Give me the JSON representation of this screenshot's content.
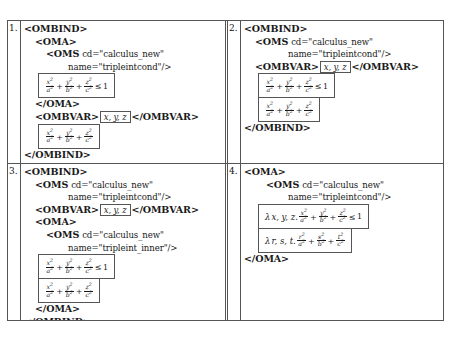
{
  "figure": {
    "type": "table",
    "rows": 2,
    "columns": 2,
    "panel_count": 4
  },
  "symbols": {
    "lambda": "λ",
    "leq": "≤",
    "plus": "+",
    "one": "1",
    "open_angle": "<",
    "close_angle": ">",
    "slash": "/"
  },
  "panels": [
    {
      "number": "1.",
      "lines": [
        {
          "indent": 0,
          "tag": "<OMBIND>",
          "attr": ""
        },
        {
          "indent": 1,
          "tag": "<OMA>",
          "attr": ""
        },
        {
          "indent": 2,
          "tag": "<OMS",
          "attr": "cd=\"calculus_new\""
        },
        {
          "indent": 3,
          "tag": "",
          "attr": "name=\"tripleintcond\"/>"
        }
      ],
      "formula_1": {
        "lambda": "",
        "vars": "",
        "terms": [
          "x/a",
          "y/b",
          "z/c"
        ],
        "relation": "≤",
        "rhs": "1"
      },
      "line_after_f1": {
        "indent": 1,
        "tag": "</OMA>",
        "attr": ""
      },
      "ombvar_line": {
        "indent": 1,
        "open": "<OMBVAR>",
        "vars": "x, y, z",
        "close": "</OMBVAR>"
      },
      "formula_2": {
        "lambda": "",
        "vars": "",
        "terms": [
          "x/a",
          "y/b",
          "z/c"
        ],
        "relation": "",
        "rhs": ""
      },
      "closing": [
        {
          "indent": 0,
          "tag": "</OMBIND>",
          "attr": ""
        }
      ]
    },
    {
      "number": "2.",
      "lines": [
        {
          "indent": 0,
          "tag": "<OMBIND>",
          "attr": ""
        },
        {
          "indent": 1,
          "tag": "<OMS",
          "attr": "cd=\"calculus_new\""
        },
        {
          "indent": 3,
          "tag": "",
          "attr": "name=\"tripleintcond\"/>"
        }
      ],
      "ombvar_line": {
        "indent": 1,
        "open": "<OMBVAR>",
        "vars": "x, y, z",
        "close": "</OMBVAR>"
      },
      "formula_1": {
        "lambda": "",
        "vars": "",
        "terms": [
          "x/a",
          "y/b",
          "z/c"
        ],
        "relation": "≤",
        "rhs": "1"
      },
      "formula_2": {
        "lambda": "",
        "vars": "",
        "terms": [
          "x/a",
          "y/b",
          "z/c"
        ],
        "relation": "",
        "rhs": ""
      },
      "closing": [
        {
          "indent": 0,
          "tag": "</OMBIND>",
          "attr": ""
        }
      ]
    },
    {
      "number": "3.",
      "lines": [
        {
          "indent": 0,
          "tag": "<OMBIND>",
          "attr": ""
        },
        {
          "indent": 1,
          "tag": "<OMS",
          "attr": "cd=\"calculus_new\""
        },
        {
          "indent": 3,
          "tag": "",
          "attr": "name=\"tripleintcond\"/>"
        }
      ],
      "ombvar_line": {
        "indent": 1,
        "open": "<OMBVAR>",
        "vars": "x, y, z",
        "close": "</OMBVAR>"
      },
      "inner_lines": [
        {
          "indent": 1,
          "tag": "<OMA>",
          "attr": ""
        },
        {
          "indent": 2,
          "tag": "<OMS",
          "attr": "cd=\"calculus_new\""
        },
        {
          "indent": 3,
          "tag": "",
          "attr": "name=\"tripleint_inner\"/>"
        }
      ],
      "formula_1": {
        "lambda": "",
        "vars": "",
        "terms": [
          "x/a",
          "y/b",
          "z/c"
        ],
        "relation": "≤",
        "rhs": "1"
      },
      "formula_2": {
        "lambda": "",
        "vars": "",
        "terms": [
          "x/a",
          "y/b",
          "z/c"
        ],
        "relation": "",
        "rhs": ""
      },
      "closing": [
        {
          "indent": 1,
          "tag": "</OMA>",
          "attr": ""
        },
        {
          "indent": 0,
          "tag": "</OMBIND>",
          "attr": ""
        }
      ]
    },
    {
      "number": "4.",
      "lines": [
        {
          "indent": 0,
          "tag": "<OMA>",
          "attr": ""
        },
        {
          "indent": 1,
          "tag": "<OMS",
          "attr": "cd=\"calculus_new\""
        },
        {
          "indent": 3,
          "tag": "",
          "attr": "name=\"tripleintcond\"/>"
        }
      ],
      "formula_1": {
        "lambda": "λ",
        "vars": "x, y, z.",
        "terms": [
          "x/a",
          "y/b",
          "z/c"
        ],
        "relation": "≤",
        "rhs": "1"
      },
      "formula_2": {
        "lambda": "λ",
        "vars": "r, s, t.",
        "terms": [
          "r/a",
          "s/b",
          "t/c"
        ],
        "relation": "",
        "rhs": ""
      },
      "closing": [
        {
          "indent": 0,
          "tag": "</OMA>",
          "attr": ""
        }
      ]
    }
  ]
}
